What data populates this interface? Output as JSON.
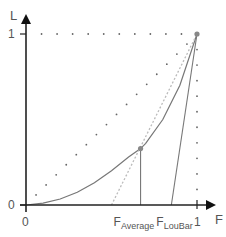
{
  "chart_data": {
    "type": "line",
    "title": "",
    "xlabel": "F",
    "ylabel": "L",
    "xlim": [
      0,
      1
    ],
    "ylim": [
      0,
      1
    ],
    "x_ticks": [
      {
        "value": 0,
        "label": "0"
      },
      {
        "value": 0.67,
        "label": "F",
        "sub": "Average"
      },
      {
        "value": 0.85,
        "label": "F",
        "sub": "LouBar"
      },
      {
        "value": 1,
        "label": "1"
      }
    ],
    "y_ticks": [
      {
        "value": 0,
        "label": "0"
      },
      {
        "value": 1,
        "label": "1"
      }
    ],
    "series": [
      {
        "name": "lorenz-curve",
        "style": "solid",
        "x": [
          0,
          0.1,
          0.2,
          0.3,
          0.4,
          0.5,
          0.6,
          0.67,
          0.7,
          0.8,
          0.9,
          1
        ],
        "y": [
          0,
          0.011,
          0.035,
          0.075,
          0.13,
          0.2,
          0.28,
          0.33,
          0.36,
          0.5,
          0.7,
          1
        ]
      },
      {
        "name": "equality-diagonal",
        "style": "dotted",
        "x": [
          0,
          1
        ],
        "y": [
          0,
          1
        ]
      },
      {
        "name": "tangent-at-average",
        "style": "dotted-light",
        "x": [
          0.5,
          1
        ],
        "y": [
          0,
          1
        ]
      },
      {
        "name": "loubar-tangent",
        "style": "solid",
        "x": [
          0.85,
          1
        ],
        "y": [
          0,
          1
        ]
      },
      {
        "name": "top-border",
        "style": "dotted",
        "x": [
          0,
          1
        ],
        "y": [
          1,
          1
        ]
      },
      {
        "name": "right-border",
        "style": "dotted",
        "x": [
          1,
          1
        ],
        "y": [
          0,
          1
        ]
      },
      {
        "name": "average-drop",
        "style": "solid",
        "x": [
          0.67,
          0.67
        ],
        "y": [
          0,
          0.33
        ]
      }
    ],
    "points": [
      {
        "name": "average-point",
        "x": 0.67,
        "y": 0.33
      },
      {
        "name": "top-right-point",
        "x": 1,
        "y": 1
      }
    ],
    "colors": {
      "axis": "#222222",
      "curve": "#777777",
      "dots": "#666666",
      "light": "#bbbbbb"
    }
  }
}
